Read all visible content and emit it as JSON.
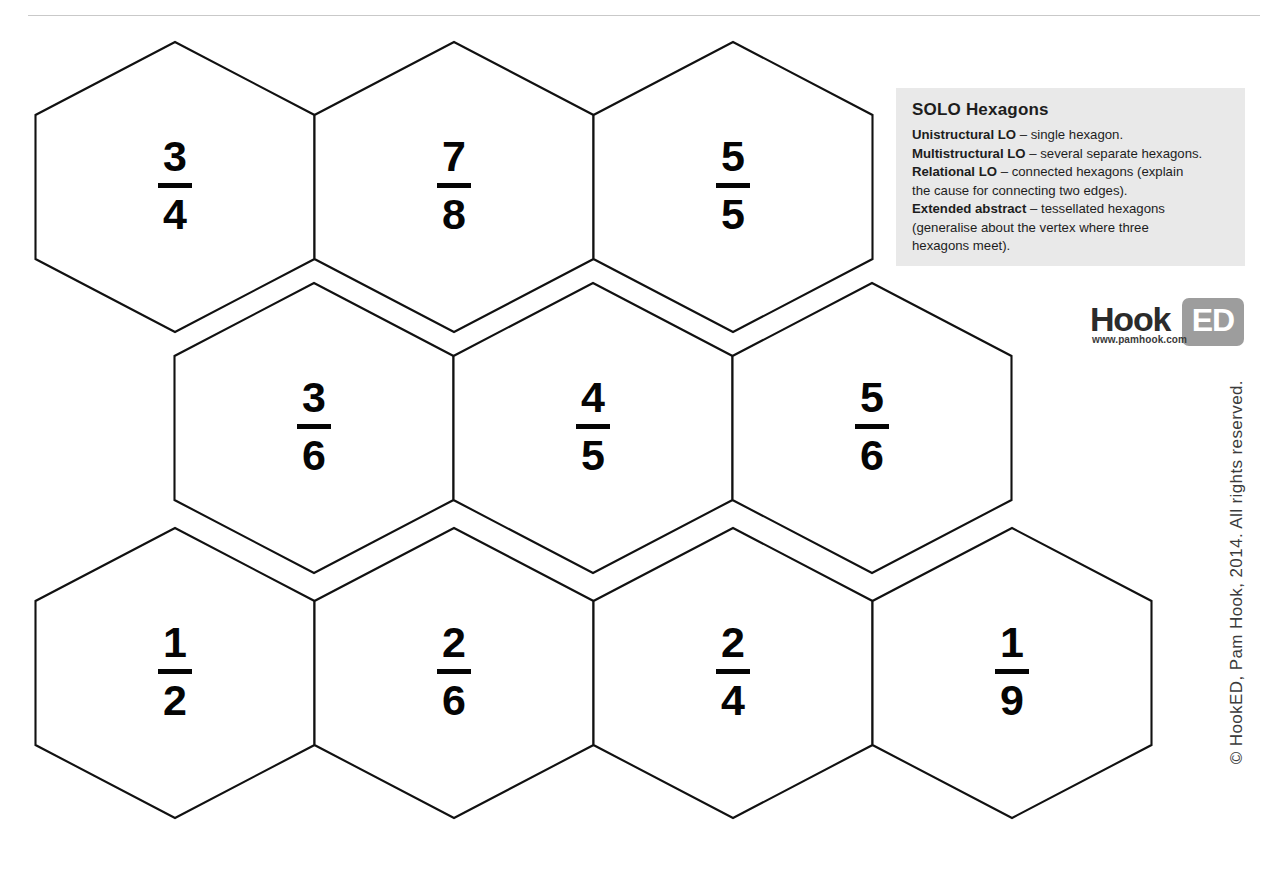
{
  "page": {
    "background_color": "#ffffff",
    "ghost_header_text": "",
    "copyright": "© HookED, Pam Hook, 2014. All rights reserved."
  },
  "solo_panel": {
    "background_color": "#e9e9e9",
    "title": "SOLO Hexagons",
    "lines": [
      {
        "label": "Unistructural LO",
        "text": " – single hexagon."
      },
      {
        "label": "Multistructural LO",
        "text": " – several separate hexagons."
      },
      {
        "label": "Relational LO",
        "text": " – connected hexagons (explain"
      },
      {
        "label": "",
        "text": "the cause for connecting two edges)."
      },
      {
        "label": "Extended abstract",
        "text": " – tessellated hexagons"
      },
      {
        "label": "",
        "text": "(generalise about the vertex where three"
      },
      {
        "label": "",
        "text": "hexagons meet)."
      }
    ]
  },
  "logo": {
    "word_dark": "Hook",
    "word_light": "ED",
    "url": "www.pamhook.com",
    "badge_color": "#9d9d9d"
  },
  "hexagons": {
    "stroke_color": "#111111",
    "fill_color": "#ffffff",
    "rows": [
      {
        "row_index": 0,
        "cells": [
          {
            "numerator": "3",
            "denominator": "4",
            "cx": 175,
            "cy": 187
          },
          {
            "numerator": "7",
            "denominator": "8",
            "cx": 454,
            "cy": 187
          },
          {
            "numerator": "5",
            "denominator": "5",
            "cx": 733,
            "cy": 187
          }
        ]
      },
      {
        "row_index": 1,
        "cells": [
          {
            "numerator": "3",
            "denominator": "6",
            "cx": 314,
            "cy": 428
          },
          {
            "numerator": "4",
            "denominator": "5",
            "cx": 593,
            "cy": 428
          },
          {
            "numerator": "5",
            "denominator": "6",
            "cx": 872,
            "cy": 428
          }
        ]
      },
      {
        "row_index": 2,
        "cells": [
          {
            "numerator": "1",
            "denominator": "2",
            "cx": 175,
            "cy": 673
          },
          {
            "numerator": "2",
            "denominator": "6",
            "cx": 454,
            "cy": 673
          },
          {
            "numerator": "2",
            "denominator": "4",
            "cx": 733,
            "cy": 673
          },
          {
            "numerator": "1",
            "denominator": "9",
            "cx": 1012,
            "cy": 673
          }
        ]
      }
    ]
  }
}
